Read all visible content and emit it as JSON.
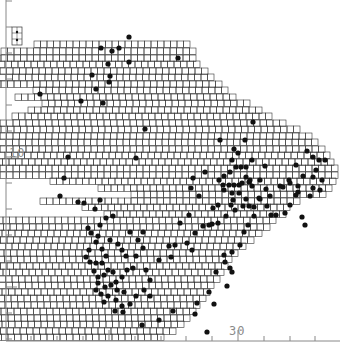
{
  "figure": {
    "type": "distribution grid map",
    "grid_cell_px": 6.5,
    "colors": {
      "grid": "#333333",
      "dot": "#111111",
      "axis": "#888888",
      "coast": "#555555"
    }
  },
  "axes": {
    "left": {
      "label": "10",
      "label_y": 152,
      "ticks_y": [
        1,
        27,
        53,
        79,
        105,
        131,
        157,
        183,
        209,
        235,
        261,
        287,
        313,
        339
      ],
      "long_ticks_y": [
        157,
        287
      ]
    },
    "bottom": {
      "label": "30",
      "label_x": 230,
      "ticks_x": [
        31,
        57,
        83,
        109,
        135,
        161,
        186,
        212,
        238,
        264,
        290,
        315
      ],
      "long_ticks_x": [
        109,
        238
      ]
    }
  },
  "legend_box": {
    "x": 12,
    "y": 27,
    "w": 10,
    "h": 18
  },
  "grid_rows": [
    [
      41,
      190,
      24
    ],
    [
      48,
      196,
      30
    ],
    [
      55,
      196,
      32
    ],
    [
      61,
      200,
      34
    ],
    [
      68,
      208,
      38
    ],
    [
      74,
      214,
      42
    ],
    [
      81,
      222,
      46
    ],
    [
      87,
      228,
      30
    ],
    [
      94,
      236,
      34
    ],
    [
      100,
      250,
      32
    ],
    [
      107,
      262,
      36
    ],
    [
      113,
      272,
      40
    ],
    [
      120,
      286,
      46
    ],
    [
      126,
      300,
      52
    ],
    [
      133,
      312,
      60
    ],
    [
      139,
      318,
      66
    ],
    [
      146,
      325,
      70
    ],
    [
      152,
      330,
      78
    ],
    [
      159,
      334,
      80
    ],
    [
      165,
      338,
      72
    ],
    [
      172,
      338,
      56
    ],
    [
      178,
      336,
      44
    ],
    [
      185,
      332,
      36
    ],
    [
      191,
      326,
      30
    ],
    [
      198,
      300,
      40
    ],
    [
      204,
      290,
      32
    ],
    [
      211,
      286,
      28
    ],
    [
      217,
      276,
      70
    ],
    [
      224,
      270,
      70
    ],
    [
      230,
      262,
      70
    ],
    [
      237,
      254,
      60
    ],
    [
      243,
      246,
      66
    ],
    [
      250,
      238,
      64
    ],
    [
      256,
      232,
      62
    ],
    [
      263,
      228,
      64
    ],
    [
      269,
      224,
      66
    ],
    [
      276,
      220,
      70
    ],
    [
      282,
      214,
      84
    ],
    [
      289,
      210,
      98
    ],
    [
      295,
      206,
      104
    ],
    [
      302,
      200,
      120
    ],
    [
      308,
      196,
      124
    ],
    [
      315,
      190,
      132
    ],
    [
      321,
      184,
      144
    ],
    [
      328,
      176,
      152
    ],
    [
      334,
      164,
      158
    ]
  ],
  "dots": [
    [
      101,
      48
    ],
    [
      112,
      51
    ],
    [
      119,
      48
    ],
    [
      108,
      64
    ],
    [
      110,
      76
    ],
    [
      92,
      75
    ],
    [
      96,
      89
    ],
    [
      103,
      103
    ],
    [
      81,
      101
    ],
    [
      40,
      94
    ],
    [
      145,
      129
    ],
    [
      178,
      58
    ],
    [
      129,
      37
    ],
    [
      109,
      82
    ],
    [
      129,
      62
    ],
    [
      136,
      158
    ],
    [
      68,
      157
    ],
    [
      64,
      178
    ],
    [
      60,
      196
    ],
    [
      252,
      160
    ],
    [
      220,
      140
    ],
    [
      253,
      122
    ],
    [
      234,
      149
    ],
    [
      238,
      153
    ],
    [
      249,
      182
    ],
    [
      232,
      193
    ],
    [
      223,
      185
    ],
    [
      235,
      210
    ],
    [
      218,
      205
    ],
    [
      224,
      190
    ],
    [
      229,
      185
    ],
    [
      234,
      185
    ],
    [
      239,
      185
    ],
    [
      219,
      180
    ],
    [
      224,
      176
    ],
    [
      230,
      172
    ],
    [
      236,
      167
    ],
    [
      241,
      167
    ],
    [
      246,
      167
    ],
    [
      246,
      177
    ],
    [
      242,
      183
    ],
    [
      252,
      186
    ],
    [
      260,
      180
    ],
    [
      239,
      193
    ],
    [
      246,
      199
    ],
    [
      243,
      206
    ],
    [
      249,
      206
    ],
    [
      254,
      207
    ],
    [
      260,
      199
    ],
    [
      266,
      189
    ],
    [
      270,
      196
    ],
    [
      280,
      186
    ],
    [
      265,
      166
    ],
    [
      233,
      200
    ],
    [
      231,
      205
    ],
    [
      226,
      216
    ],
    [
      218,
      223
    ],
    [
      209,
      225
    ],
    [
      213,
      208
    ],
    [
      199,
      196
    ],
    [
      191,
      188
    ],
    [
      193,
      178
    ],
    [
      205,
      172
    ],
    [
      245,
      140
    ],
    [
      296,
      165
    ],
    [
      290,
      183
    ],
    [
      283,
      187
    ],
    [
      298,
      186
    ],
    [
      303,
      176
    ],
    [
      313,
      177
    ],
    [
      313,
      188
    ],
    [
      298,
      192
    ],
    [
      307,
      151
    ],
    [
      313,
      157
    ],
    [
      319,
      160
    ],
    [
      322,
      180
    ],
    [
      316,
      170
    ],
    [
      325,
      160
    ],
    [
      271,
      215
    ],
    [
      285,
      213
    ],
    [
      302,
      217
    ],
    [
      305,
      225
    ],
    [
      289,
      180
    ],
    [
      296,
      195
    ],
    [
      310,
      196
    ],
    [
      320,
      190
    ],
    [
      254,
      216
    ],
    [
      248,
      225
    ],
    [
      244,
      232
    ],
    [
      240,
      245
    ],
    [
      232,
      252
    ],
    [
      224,
      255
    ],
    [
      212,
      224
    ],
    [
      203,
      226
    ],
    [
      195,
      233
    ],
    [
      189,
      215
    ],
    [
      187,
      243
    ],
    [
      180,
      223
    ],
    [
      250,
      180
    ],
    [
      232,
      160
    ],
    [
      259,
      198
    ],
    [
      267,
      206
    ],
    [
      276,
      215
    ],
    [
      290,
      205
    ],
    [
      78,
      202
    ],
    [
      84,
      203
    ],
    [
      100,
      200
    ],
    [
      95,
      209
    ],
    [
      91,
      233
    ],
    [
      98,
      236
    ],
    [
      96,
      242
    ],
    [
      89,
      250
    ],
    [
      86,
      257
    ],
    [
      90,
      262
    ],
    [
      96,
      263
    ],
    [
      102,
      263
    ],
    [
      108,
      270
    ],
    [
      113,
      272
    ],
    [
      104,
      275
    ],
    [
      98,
      277
    ],
    [
      94,
      271
    ],
    [
      98,
      283
    ],
    [
      105,
      287
    ],
    [
      111,
      285
    ],
    [
      117,
      290
    ],
    [
      124,
      292
    ],
    [
      116,
      282
    ],
    [
      122,
      277
    ],
    [
      127,
      270
    ],
    [
      133,
      268
    ],
    [
      136,
      256
    ],
    [
      143,
      248
    ],
    [
      143,
      232
    ],
    [
      110,
      240
    ],
    [
      130,
      232
    ],
    [
      118,
      244
    ],
    [
      122,
      250
    ],
    [
      126,
      256
    ],
    [
      106,
      256
    ],
    [
      102,
      249
    ],
    [
      100,
      225
    ],
    [
      106,
      218
    ],
    [
      113,
      216
    ],
    [
      88,
      228
    ],
    [
      101,
      294
    ],
    [
      108,
      296
    ],
    [
      116,
      300
    ],
    [
      122,
      306
    ],
    [
      115,
      311
    ],
    [
      123,
      312
    ],
    [
      130,
      304
    ],
    [
      136,
      296
    ],
    [
      144,
      290
    ],
    [
      96,
      290
    ],
    [
      104,
      302
    ],
    [
      150,
      296
    ],
    [
      171,
      257
    ],
    [
      175,
      245
    ],
    [
      192,
      250
    ],
    [
      209,
      292
    ],
    [
      232,
      272
    ],
    [
      227,
      286
    ],
    [
      214,
      304
    ],
    [
      195,
      314
    ],
    [
      173,
      311
    ],
    [
      142,
      325
    ],
    [
      159,
      320
    ],
    [
      207,
      332
    ],
    [
      169,
      246
    ],
    [
      197,
      303
    ],
    [
      216,
      272
    ],
    [
      230,
      268
    ],
    [
      225,
      262
    ],
    [
      146,
      270
    ],
    [
      150,
      280
    ],
    [
      159,
      260
    ],
    [
      138,
      240
    ]
  ]
}
